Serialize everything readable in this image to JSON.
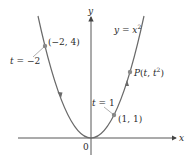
{
  "diagram": {
    "type": "parametric-curve-plot",
    "curve_equation": {
      "lhs": "y",
      "eq": " = ",
      "rhs": "x",
      "exp": "2"
    },
    "axes": {
      "x_label": "x",
      "y_label": "y",
      "origin_label": "0"
    },
    "points": [
      {
        "label": "(−2, 4)",
        "x": -2,
        "y": 4,
        "param_label": {
          "t": "t",
          "eq": " = ",
          "val": "−2"
        }
      },
      {
        "label": "(1, 1)",
        "x": 1,
        "y": 1,
        "param_label": {
          "t": "t",
          "eq": " = ",
          "val": "1"
        }
      },
      {
        "label": "P(t, t",
        "label_exp": "2",
        "label_close": ")",
        "x": 1.7,
        "y": 2.89
      }
    ],
    "direction_arrows": "increasing t (left branch downward, right branch upward)",
    "colors": {
      "curve": "#6a6a6a",
      "axes": "#444444",
      "point": "#8a8a8a",
      "text": "#2a2a2a"
    }
  }
}
